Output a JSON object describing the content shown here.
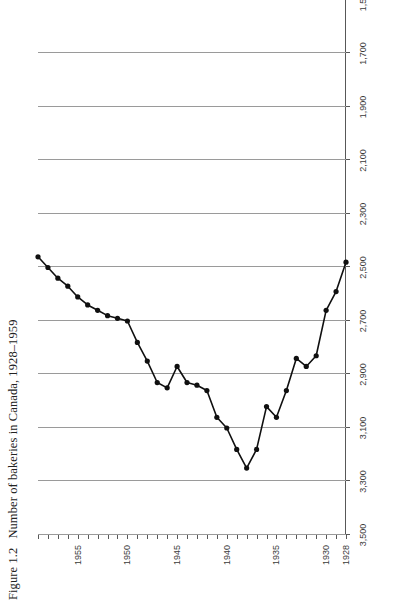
{
  "figure": {
    "number": "Figure 1.2",
    "caption": "Number of bakeries in Canada, 1928–1959"
  },
  "colors": {
    "background": "#ffffff",
    "line": "#101010",
    "marker": "#101010",
    "gridline": "#9a9a9a",
    "axis": "#585858",
    "text": "#3a3a3a"
  },
  "chart_data": {
    "type": "line",
    "title": "Number of bakeries in Canada, 1928–1959",
    "xlabel": "",
    "ylabel": "",
    "orientation": "rotated-90-ccw",
    "grid": true,
    "legend": false,
    "note": "Figure is printed sideways on the page; the value axis (1,500–3,500) runs along the bottom of the portrait image and the year axis runs up the right side. The plotted line is cropped at the top of the page after 1956.",
    "xlim": [
      1928,
      1959
    ],
    "ylim": [
      1500,
      3500
    ],
    "xticks": [
      1928,
      1930,
      1935,
      1940,
      1945,
      1950,
      1955
    ],
    "xtick_labels": [
      "1928",
      "1930",
      "1935",
      "1940",
      "1945",
      "1950",
      "1955"
    ],
    "yticks": [
      1500,
      1700,
      1900,
      2100,
      2300,
      2500,
      2700,
      2900,
      3100,
      3300,
      3500
    ],
    "ytick_labels": [
      "1,500",
      "1,700",
      "1,900",
      "2,100",
      "2,300",
      "2,500",
      "2,700",
      "2,900",
      "3,100",
      "3,300",
      "3,500"
    ],
    "series": [
      {
        "name": "Number of bakeries",
        "x": [
          1928,
          1929,
          1930,
          1931,
          1932,
          1933,
          1934,
          1935,
          1936,
          1937,
          1938,
          1939,
          1940,
          1941,
          1942,
          1943,
          1944,
          1945,
          1946,
          1947,
          1948,
          1949,
          1950,
          1951,
          1952,
          1953,
          1954,
          1955,
          1956,
          1957,
          1958,
          1959
        ],
        "values": [
          2480,
          2590,
          2660,
          2830,
          2870,
          2840,
          2960,
          3060,
          3020,
          3180,
          3250,
          3180,
          3100,
          3060,
          2960,
          2940,
          2930,
          2870,
          2950,
          2930,
          2850,
          2780,
          2700,
          2690,
          2680,
          2660,
          2640,
          2610,
          2570,
          2540,
          2500,
          2460
        ]
      }
    ]
  }
}
